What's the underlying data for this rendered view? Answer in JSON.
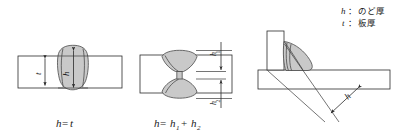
{
  "figure": {
    "legend": [
      {
        "symbol": "h",
        "separator": "：",
        "text": "のど厚"
      },
      {
        "symbol": "t",
        "separator": "：",
        "text": "板厚"
      }
    ],
    "panels": [
      {
        "id": "butt-weld-full-penetration",
        "caption": "h＝t",
        "caption_symbol_left": "h",
        "caption_operator": "=",
        "caption_symbol_right": "t",
        "dimensions": [
          {
            "name": "plate-thickness",
            "label": "t"
          },
          {
            "name": "throat-thickness",
            "label": "h"
          }
        ]
      },
      {
        "id": "double-bevel-weld",
        "caption": "h＝h1＋h2",
        "caption_symbol_left": "h",
        "caption_operator": "=",
        "caption_term1": "h",
        "caption_term1_sub": "1",
        "caption_plus": "+",
        "caption_term2": "h",
        "caption_term2_sub": "2",
        "dimensions": [
          {
            "name": "upper-throat",
            "label": "h",
            "sub": "1"
          },
          {
            "name": "lower-throat",
            "label": "h",
            "sub": "2"
          }
        ]
      },
      {
        "id": "fillet-weld",
        "caption": "",
        "dimensions": [
          {
            "name": "throat-thickness",
            "label": "h"
          }
        ]
      }
    ],
    "colors": {
      "line": "#2b2b2b",
      "bead_fill": "#c9c9c9",
      "bead_fill_light": "#d6d6d6",
      "background": "#ffffff",
      "text": "#1a1a1a"
    }
  }
}
